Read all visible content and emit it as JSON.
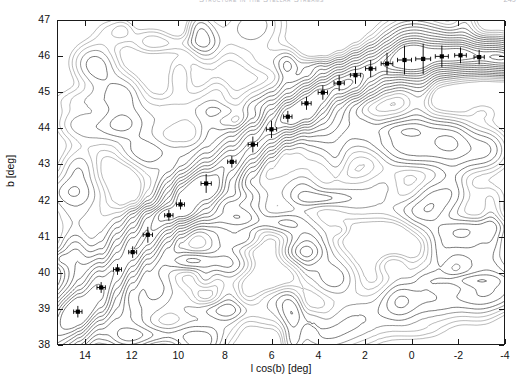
{
  "header": {
    "title": "Structure in the Stellar Streams",
    "page_number": "249"
  },
  "figure": {
    "name": "stream-contour-plot"
  },
  "chart_data": {
    "type": "contour",
    "title": "",
    "xlabel": "l cos(b) [deg]",
    "ylabel": "b [deg]",
    "xlim": [
      15.2,
      -4.0
    ],
    "ylim": [
      38,
      47
    ],
    "x_reversed": true,
    "grid": false,
    "legend": null,
    "xticks": [
      14,
      12,
      10,
      8,
      6,
      4,
      2,
      0,
      -2,
      -4
    ],
    "xticklabels": [
      "14",
      "12",
      "10",
      "8",
      "6",
      "4",
      "2",
      "0",
      "-2",
      "-4"
    ],
    "yticks": [
      38,
      39,
      40,
      41,
      42,
      43,
      44,
      45,
      46,
      47
    ],
    "yticklabels": [
      "38",
      "39",
      "40",
      "41",
      "42",
      "43",
      "44",
      "45",
      "46",
      "47"
    ],
    "contour_color": "#2b2b2b",
    "marker_color": "#000000",
    "ridge_points": [
      {
        "x": 14.35,
        "y": 38.95,
        "xerr": 0.18,
        "yerr": 0.16
      },
      {
        "x": 13.35,
        "y": 39.62,
        "xerr": 0.18,
        "yerr": 0.15
      },
      {
        "x": 12.65,
        "y": 40.12,
        "xerr": 0.17,
        "yerr": 0.15
      },
      {
        "x": 12.0,
        "y": 40.6,
        "xerr": 0.17,
        "yerr": 0.16
      },
      {
        "x": 11.35,
        "y": 41.08,
        "xerr": 0.2,
        "yerr": 0.22
      },
      {
        "x": 10.45,
        "y": 41.62,
        "xerr": 0.18,
        "yerr": 0.15
      },
      {
        "x": 9.95,
        "y": 41.92,
        "xerr": 0.17,
        "yerr": 0.14
      },
      {
        "x": 8.85,
        "y": 42.5,
        "xerr": 0.22,
        "yerr": 0.26
      },
      {
        "x": 7.75,
        "y": 43.1,
        "xerr": 0.18,
        "yerr": 0.16
      },
      {
        "x": 6.85,
        "y": 43.58,
        "xerr": 0.2,
        "yerr": 0.22
      },
      {
        "x": 6.05,
        "y": 44.0,
        "xerr": 0.22,
        "yerr": 0.24
      },
      {
        "x": 5.35,
        "y": 44.35,
        "xerr": 0.18,
        "yerr": 0.16
      },
      {
        "x": 4.55,
        "y": 44.72,
        "xerr": 0.2,
        "yerr": 0.18
      },
      {
        "x": 3.85,
        "y": 45.02,
        "xerr": 0.2,
        "yerr": 0.2
      },
      {
        "x": 3.15,
        "y": 45.28,
        "xerr": 0.22,
        "yerr": 0.22
      },
      {
        "x": 2.45,
        "y": 45.5,
        "xerr": 0.22,
        "yerr": 0.24
      },
      {
        "x": 1.8,
        "y": 45.68,
        "xerr": 0.22,
        "yerr": 0.24
      },
      {
        "x": 1.1,
        "y": 45.82,
        "xerr": 0.25,
        "yerr": 0.3
      },
      {
        "x": 0.35,
        "y": 45.92,
        "xerr": 0.3,
        "yerr": 0.4
      },
      {
        "x": -0.45,
        "y": 45.95,
        "xerr": 0.32,
        "yerr": 0.42
      },
      {
        "x": -1.25,
        "y": 46.02,
        "xerr": 0.28,
        "yerr": 0.3
      },
      {
        "x": -2.05,
        "y": 46.05,
        "xerr": 0.25,
        "yerr": 0.22
      },
      {
        "x": -2.85,
        "y": 46.0,
        "xerr": 0.22,
        "yerr": 0.2
      }
    ]
  }
}
